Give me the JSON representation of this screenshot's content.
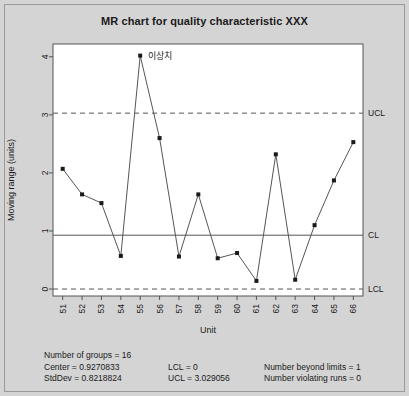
{
  "figure": {
    "title": "MR chart for quality characteristic XXX",
    "background_color": "#d4d4d4",
    "plot_background_color": "#ffffff",
    "border_color": "#9a9a9a"
  },
  "chart_data": {
    "type": "line",
    "title": "MR chart for quality characteristic XXX",
    "xlabel": "Unit",
    "ylabel": "Moving range (units)",
    "categories": [
      "51",
      "52",
      "53",
      "54",
      "55",
      "56",
      "57",
      "58",
      "59",
      "60",
      "61",
      "62",
      "63",
      "64",
      "65",
      "66"
    ],
    "values": [
      2.07,
      1.63,
      1.48,
      0.57,
      4.02,
      2.6,
      0.56,
      1.63,
      0.53,
      0.62,
      0.14,
      2.32,
      0.16,
      1.1,
      1.87,
      2.53
    ],
    "ylim": [
      -0.12,
      4.22
    ],
    "yticks": [
      0,
      1,
      2,
      3,
      4
    ],
    "ytick_labels": [
      "0",
      "1",
      "2",
      "3",
      "4"
    ],
    "grid": false,
    "marker": "square",
    "marker_color": "#1a1a1a",
    "line_color": "#555555",
    "control_limits": {
      "ucl": {
        "value": 3.029056,
        "label": "UCL",
        "style": "dashed",
        "color": "#555555"
      },
      "cl": {
        "value": 0.9270833,
        "label": "CL",
        "style": "solid",
        "color": "#555555"
      },
      "lcl": {
        "value": 0,
        "label": "LCL",
        "style": "dashed",
        "color": "#555555"
      }
    },
    "annotations": [
      {
        "text": "이상치",
        "point_index": 4,
        "value": 4.02
      }
    ]
  },
  "stats": {
    "column1": [
      "Number of groups = 16",
      "Center = 0.9270833",
      "StdDev = 0.8218824"
    ],
    "column2": [
      "LCL = 0",
      "UCL = 3.029056"
    ],
    "column3": [
      "Number beyond limits = 1",
      "Number violating runs = 0"
    ]
  }
}
